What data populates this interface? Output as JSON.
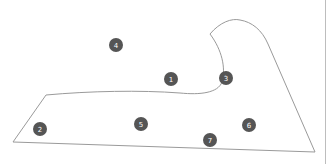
{
  "diagram": {
    "outline_color": "#9a9a9a",
    "marker_fill": "#555555",
    "marker_text_color": "#ffffff",
    "right_rule_color": "#bdbdbd",
    "markers": [
      {
        "label": "1",
        "x": 171,
        "y": 79
      },
      {
        "label": "2",
        "x": 40,
        "y": 129
      },
      {
        "label": "3",
        "x": 226,
        "y": 78
      },
      {
        "label": "4",
        "x": 116,
        "y": 45
      },
      {
        "label": "5",
        "x": 141,
        "y": 124
      },
      {
        "label": "6",
        "x": 249,
        "y": 125
      },
      {
        "label": "7",
        "x": 210,
        "y": 140
      }
    ]
  }
}
